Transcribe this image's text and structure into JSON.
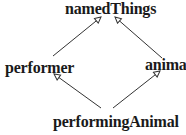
{
  "diagram": {
    "type": "inheritance-hierarchy",
    "nodes": {
      "namedThings": {
        "label": "namedThings"
      },
      "performer": {
        "label": "performer"
      },
      "animal": {
        "label": "animal"
      },
      "performingAnimal": {
        "label": "performingAnimal"
      }
    },
    "edges": [
      {
        "from": "performer",
        "to": "namedThings",
        "arrow": "open-triangle"
      },
      {
        "from": "animal",
        "to": "namedThings",
        "arrow": "open-triangle"
      },
      {
        "from": "performingAnimal",
        "to": "performer",
        "arrow": "open-triangle"
      },
      {
        "from": "performingAnimal",
        "to": "animal",
        "arrow": "open-triangle"
      }
    ],
    "colors": {
      "line": "#333333",
      "text": "#1a1a1a",
      "background": "#ffffff"
    }
  }
}
